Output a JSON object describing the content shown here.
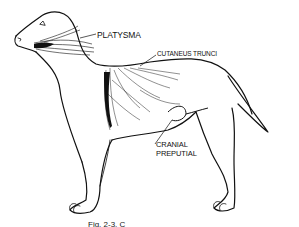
{
  "figure": {
    "labels": {
      "platysma": "PLATYSMA",
      "cutaneus_trunci": "CUTANEUS TRUNCI",
      "cranial_preputial_line1": "CRANIAL",
      "cranial_preputial_line2": "PREPUTIAL"
    },
    "caption": "Fig. 2-3. C",
    "colors": {
      "ink": "#111111",
      "background": "#ffffff"
    }
  }
}
